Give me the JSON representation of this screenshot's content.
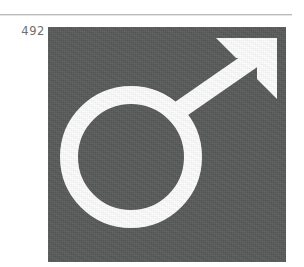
{
  "page": {
    "background_color": "#ffffff",
    "width": 304,
    "height": 267
  },
  "rule": {
    "name": "horizontal-rule",
    "color": "#b9babd"
  },
  "figure": {
    "number_label": "492",
    "label_color": "#6e6f71",
    "plate": {
      "name": "dark-square-plate",
      "fill_color": "#595a5a",
      "left": 48,
      "top": 27,
      "width": 238,
      "height": 235
    },
    "symbol": {
      "name": "mars-male-symbol",
      "description": "Mars / male gender symbol: circle with diagonal arrow pointing up-right",
      "stroke_color": "#ffffff",
      "stroke_width": 18,
      "circle_center_x": 83,
      "circle_center_y": 130,
      "circle_outer_radius": 71,
      "arrow_direction": "up-right",
      "arrow_tip_x": 229,
      "arrow_tip_y": 11
    }
  }
}
